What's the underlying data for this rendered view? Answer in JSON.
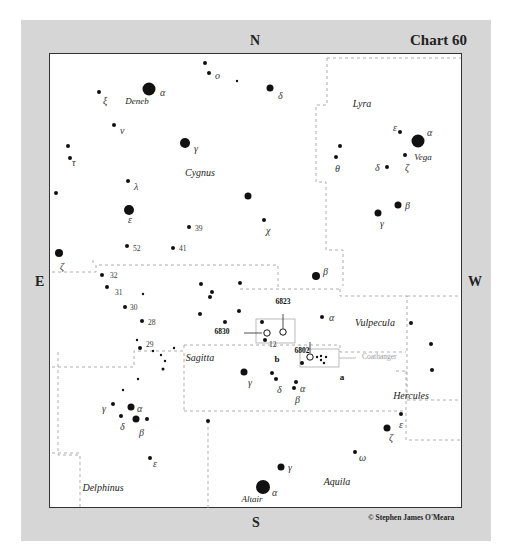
{
  "chart": {
    "title": "Chart 60",
    "credit": "© Stephen James O'Meara",
    "compass": {
      "north": "N",
      "south": "S",
      "east": "E",
      "west": "W"
    }
  },
  "constellations": [
    {
      "name": "Cygnus",
      "x": 200,
      "y": 176
    },
    {
      "name": "Lyra",
      "x": 362,
      "y": 107
    },
    {
      "name": "Vulpecula",
      "x": 375,
      "y": 326
    },
    {
      "name": "Sagitta",
      "x": 200,
      "y": 361
    },
    {
      "name": "Hercules",
      "x": 411,
      "y": 399
    },
    {
      "name": "Delphinus",
      "x": 103,
      "y": 491
    },
    {
      "name": "Aquila",
      "x": 337,
      "y": 485
    }
  ],
  "named_stars": [
    {
      "name": "Deneb",
      "x": 137,
      "y": 104
    },
    {
      "name": "Vega",
      "x": 423,
      "y": 160
    },
    {
      "name": "Altair",
      "x": 252,
      "y": 502
    }
  ],
  "objects": [
    {
      "id": "6823",
      "x": 283,
      "y": 304,
      "circle_x": 283,
      "circle_y": 332
    },
    {
      "id": "6830",
      "x": 222,
      "y": 334,
      "circle_x": 267,
      "circle_y": 333
    },
    {
      "id": "6802",
      "x": 302,
      "y": 353,
      "circle_x": 310,
      "circle_y": 357
    }
  ],
  "boxes": [
    {
      "label": "b",
      "x": 277,
      "y": 362
    },
    {
      "label": "a",
      "x": 342,
      "y": 380
    }
  ],
  "asterism": {
    "label": "Coathanger",
    "x": 362,
    "y": 359
  },
  "stars": [
    {
      "x": 149,
      "y": 89,
      "r": 6.5,
      "label": "α",
      "lx": 160,
      "ly": 96
    },
    {
      "x": 205,
      "y": 63,
      "r": 2,
      "label": "",
      "lx": 0,
      "ly": 0
    },
    {
      "x": 209,
      "y": 73,
      "r": 2,
      "label": "o",
      "lx": 215,
      "ly": 79
    },
    {
      "x": 237,
      "y": 81,
      "r": 1.2,
      "label": "",
      "lx": 0,
      "ly": 0
    },
    {
      "x": 270,
      "y": 88,
      "r": 3.5,
      "label": "δ",
      "lx": 278,
      "ly": 99
    },
    {
      "x": 99,
      "y": 92,
      "r": 2,
      "label": "ξ",
      "lx": 103,
      "ly": 104
    },
    {
      "x": 114,
      "y": 125,
      "r": 2,
      "label": "ν",
      "lx": 120,
      "ly": 134
    },
    {
      "x": 185,
      "y": 143,
      "r": 5,
      "label": "γ",
      "lx": 194,
      "ly": 152
    },
    {
      "x": 68,
      "y": 146,
      "r": 2,
      "label": "",
      "lx": 0,
      "ly": 0
    },
    {
      "x": 70,
      "y": 158,
      "r": 2,
      "label": "τ",
      "lx": 72,
      "ly": 166
    },
    {
      "x": 128,
      "y": 181,
      "r": 2,
      "label": "λ",
      "lx": 134,
      "ly": 190
    },
    {
      "x": 56,
      "y": 193,
      "r": 2,
      "label": "",
      "lx": 0,
      "ly": 0
    },
    {
      "x": 248,
      "y": 196,
      "r": 3.5,
      "label": "",
      "lx": 0,
      "ly": 0
    },
    {
      "x": 129,
      "y": 210,
      "r": 5,
      "label": "ε",
      "lx": 128,
      "ly": 223
    },
    {
      "x": 189,
      "y": 227,
      "r": 2,
      "label": "39",
      "lx": 195,
      "ly": 231
    },
    {
      "x": 264,
      "y": 220,
      "r": 2,
      "label": "χ",
      "lx": 266,
      "ly": 234
    },
    {
      "x": 127,
      "y": 246,
      "r": 2,
      "label": "52",
      "lx": 133,
      "ly": 251
    },
    {
      "x": 173,
      "y": 248,
      "r": 2,
      "label": "41",
      "lx": 179,
      "ly": 251
    },
    {
      "x": 59,
      "y": 253,
      "r": 4,
      "label": "ζ",
      "lx": 60,
      "ly": 270
    },
    {
      "x": 102,
      "y": 275,
      "r": 2,
      "label": "32",
      "lx": 110,
      "ly": 278
    },
    {
      "x": 107,
      "y": 287,
      "r": 2,
      "label": "31",
      "lx": 115,
      "ly": 295
    },
    {
      "x": 143,
      "y": 294,
      "r": 1.2,
      "label": "",
      "lx": 0,
      "ly": 0
    },
    {
      "x": 125,
      "y": 307,
      "r": 2,
      "label": "30",
      "lx": 130,
      "ly": 310
    },
    {
      "x": 142,
      "y": 321,
      "r": 2,
      "label": "28",
      "lx": 148,
      "ly": 325
    },
    {
      "x": 137,
      "y": 340,
      "r": 1.2,
      "label": "",
      "lx": 0,
      "ly": 0
    },
    {
      "x": 140,
      "y": 348,
      "r": 2,
      "label": "29",
      "lx": 146,
      "ly": 347
    },
    {
      "x": 153,
      "y": 351,
      "r": 1.2,
      "label": "",
      "lx": 0,
      "ly": 0
    },
    {
      "x": 161,
      "y": 355,
      "r": 1.2,
      "label": "",
      "lx": 0,
      "ly": 0
    },
    {
      "x": 174,
      "y": 348,
      "r": 1.2,
      "label": "",
      "lx": 0,
      "ly": 0
    },
    {
      "x": 165,
      "y": 361,
      "r": 1.2,
      "label": "",
      "lx": 0,
      "ly": 0
    },
    {
      "x": 163,
      "y": 369,
      "r": 1.5,
      "label": "",
      "lx": 0,
      "ly": 0
    },
    {
      "x": 138,
      "y": 379,
      "r": 1.2,
      "label": "",
      "lx": 0,
      "ly": 0
    },
    {
      "x": 123,
      "y": 390,
      "r": 1.2,
      "label": "",
      "lx": 0,
      "ly": 0
    },
    {
      "x": 113,
      "y": 404,
      "r": 2,
      "label": "γ",
      "lx": 102,
      "ly": 412
    },
    {
      "x": 131,
      "y": 407,
      "r": 3.5,
      "label": "α",
      "lx": 137,
      "ly": 412
    },
    {
      "x": 121,
      "y": 416,
      "r": 2,
      "label": "δ",
      "lx": 120,
      "ly": 430
    },
    {
      "x": 136,
      "y": 419,
      "r": 3.5,
      "label": "β",
      "lx": 139,
      "ly": 436
    },
    {
      "x": 147,
      "y": 419,
      "r": 2,
      "label": "",
      "lx": 0,
      "ly": 0
    },
    {
      "x": 150,
      "y": 458,
      "r": 2,
      "label": "ε",
      "lx": 153,
      "ly": 467
    },
    {
      "x": 201,
      "y": 284,
      "r": 2,
      "label": "",
      "lx": 0,
      "ly": 0
    },
    {
      "x": 240,
      "y": 283,
      "r": 2,
      "label": "",
      "lx": 0,
      "ly": 0
    },
    {
      "x": 212,
      "y": 292,
      "r": 2,
      "label": "",
      "lx": 0,
      "ly": 0
    },
    {
      "x": 210,
      "y": 297,
      "r": 2,
      "label": "",
      "lx": 0,
      "ly": 0
    },
    {
      "x": 200,
      "y": 314,
      "r": 2,
      "label": "",
      "lx": 0,
      "ly": 0
    },
    {
      "x": 239,
      "y": 311,
      "r": 2,
      "label": "",
      "lx": 0,
      "ly": 0
    },
    {
      "x": 225,
      "y": 322,
      "r": 2,
      "label": "",
      "lx": 0,
      "ly": 0
    },
    {
      "x": 262,
      "y": 322,
      "r": 2,
      "label": "",
      "lx": 0,
      "ly": 0
    },
    {
      "x": 265,
      "y": 340,
      "r": 2,
      "label": "12",
      "lx": 269,
      "ly": 347
    },
    {
      "x": 316,
      "y": 276,
      "r": 4,
      "label": "β",
      "lx": 323,
      "ly": 275
    },
    {
      "x": 322,
      "y": 317,
      "r": 2,
      "label": "α",
      "lx": 329,
      "ly": 321
    },
    {
      "x": 244,
      "y": 372,
      "r": 3.5,
      "label": "γ",
      "lx": 248,
      "ly": 386
    },
    {
      "x": 272,
      "y": 373,
      "r": 2,
      "label": "",
      "lx": 0,
      "ly": 0
    },
    {
      "x": 276,
      "y": 379,
      "r": 2,
      "label": "δ",
      "lx": 277,
      "ly": 393
    },
    {
      "x": 296,
      "y": 382,
      "r": 2,
      "label": "α",
      "lx": 300,
      "ly": 392
    },
    {
      "x": 294,
      "y": 388,
      "r": 2,
      "label": "β",
      "lx": 295,
      "ly": 403
    },
    {
      "x": 302,
      "y": 363,
      "r": 2,
      "label": "",
      "lx": 0,
      "ly": 0
    },
    {
      "x": 317,
      "y": 357,
      "r": 1.2,
      "label": "",
      "lx": 0,
      "ly": 0
    },
    {
      "x": 321,
      "y": 356,
      "r": 1.2,
      "label": "",
      "lx": 0,
      "ly": 0
    },
    {
      "x": 326,
      "y": 357,
      "r": 1.2,
      "label": "",
      "lx": 0,
      "ly": 0
    },
    {
      "x": 321,
      "y": 360,
      "r": 1.2,
      "label": "",
      "lx": 0,
      "ly": 0
    },
    {
      "x": 324,
      "y": 363,
      "r": 1.2,
      "label": "",
      "lx": 0,
      "ly": 0
    },
    {
      "x": 411,
      "y": 323,
      "r": 2,
      "label": "",
      "lx": 0,
      "ly": 0
    },
    {
      "x": 431,
      "y": 344,
      "r": 2,
      "label": "",
      "lx": 0,
      "ly": 0
    },
    {
      "x": 432,
      "y": 370,
      "r": 2,
      "label": "",
      "lx": 0,
      "ly": 0
    },
    {
      "x": 401,
      "y": 414,
      "r": 2,
      "label": "ε",
      "lx": 399,
      "ly": 428
    },
    {
      "x": 387,
      "y": 428,
      "r": 3.5,
      "label": "ζ",
      "lx": 389,
      "ly": 441
    },
    {
      "x": 208,
      "y": 421,
      "r": 2,
      "label": "",
      "lx": 0,
      "ly": 0
    },
    {
      "x": 355,
      "y": 452,
      "r": 2,
      "label": "ω",
      "lx": 359,
      "ly": 461
    },
    {
      "x": 281,
      "y": 467,
      "r": 3.5,
      "label": "γ",
      "lx": 288,
      "ly": 471
    },
    {
      "x": 263,
      "y": 487,
      "r": 7,
      "label": "α",
      "lx": 272,
      "ly": 496
    },
    {
      "x": 340,
      "y": 146,
      "r": 2,
      "label": "",
      "lx": 0,
      "ly": 0
    },
    {
      "x": 336,
      "y": 157,
      "r": 2,
      "label": "θ",
      "lx": 335,
      "ly": 172
    },
    {
      "x": 400,
      "y": 132,
      "r": 2,
      "label": "ε",
      "lx": 393,
      "ly": 131
    },
    {
      "x": 418,
      "y": 141,
      "r": 6.5,
      "label": "α",
      "lx": 427,
      "ly": 136
    },
    {
      "x": 405,
      "y": 155,
      "r": 2,
      "label": "ζ",
      "lx": 405,
      "ly": 171
    },
    {
      "x": 387,
      "y": 167,
      "r": 2,
      "label": "δ",
      "lx": 375,
      "ly": 171
    },
    {
      "x": 398,
      "y": 205,
      "r": 3.5,
      "label": "β",
      "lx": 405,
      "ly": 209
    },
    {
      "x": 378,
      "y": 213,
      "r": 3.5,
      "label": "γ",
      "lx": 380,
      "ly": 227
    }
  ],
  "boundaries": [
    "M 327 58 L 461 58",
    "M 327 58 L 327 105 L 316 105 L 316 182 L 326 182 L 326 250 L 343 250 L 343 286",
    "M 52 272 L 96 272 L 96 265 L 278 265 L 278 266",
    "M 278 266 L 278 289",
    "M 240 289 L 340 289",
    "M 340 289 L 340 296 L 407 296 L 407 400",
    "M 407 296 L 461 296",
    "M 407 400 L 461 400",
    "M 52 367 L 134 367 L 134 351 L 184 351 L 184 411",
    "M 184 345 L 184 351",
    "M 184 345 L 340 345 L 340 352 L 406 352",
    "M 184 411 L 406 411",
    "M 396 371 L 406 371",
    "M 58 352 L 58 455 L 80 455 L 80 508",
    "M 52 453 L 80 453",
    "M 208 421 L 208 508",
    "M 406 371 L 406 440 L 461 440",
    "M 93 260 L 93 265"
  ]
}
